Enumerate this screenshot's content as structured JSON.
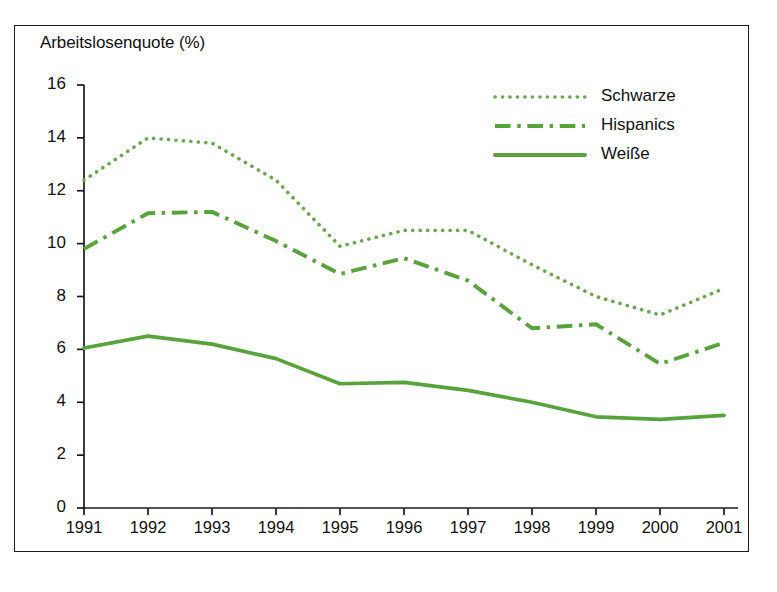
{
  "chart_data": {
    "type": "line",
    "title": "Arbeitslosenquote (%)",
    "xlabel": "",
    "ylabel": "",
    "x": [
      "1991",
      "1992",
      "1993",
      "1994",
      "1995",
      "1996",
      "1997",
      "1998",
      "1999",
      "2000",
      "2001"
    ],
    "xlim": [
      1991,
      2001
    ],
    "ylim": [
      0,
      16
    ],
    "yticks": [
      "0",
      "2",
      "4",
      "6",
      "8",
      "10",
      "12",
      "14",
      "16"
    ],
    "ytick_values": [
      0,
      2,
      4,
      6,
      8,
      10,
      12,
      14,
      16
    ],
    "grid": false,
    "legend_position": "top-right",
    "series": [
      {
        "name": "Schwarze",
        "style": "dotted",
        "color": "#6aa84f",
        "values": [
          12.4,
          14.0,
          13.8,
          12.4,
          9.9,
          10.5,
          10.5,
          9.2,
          8.0,
          7.3,
          8.3
        ]
      },
      {
        "name": "Hispanics",
        "style": "dash-dot",
        "color": "#58a33c",
        "values": [
          9.8,
          11.15,
          11.2,
          10.1,
          8.85,
          9.45,
          8.6,
          6.8,
          6.95,
          5.45,
          6.25
        ]
      },
      {
        "name": "Weiße",
        "style": "solid",
        "color": "#58a33c",
        "values": [
          6.05,
          6.5,
          6.2,
          5.65,
          4.7,
          4.75,
          4.45,
          4.0,
          3.45,
          3.35,
          3.5
        ]
      }
    ]
  },
  "axis": {
    "tick_color": "#1b1b1b",
    "label_color": "#111111"
  },
  "frame": {
    "border_color": "#1b1b1b"
  }
}
